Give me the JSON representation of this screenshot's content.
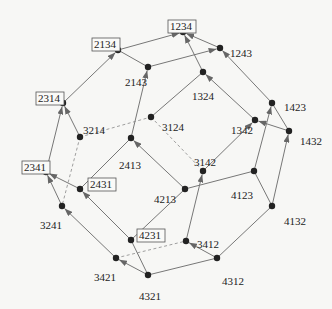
{
  "diagram": {
    "colors": {
      "edge": "#777777",
      "dashed": "#888888",
      "node": "#222222",
      "label": "#222222",
      "background": "#f7f7f5"
    },
    "nodes": [
      {
        "id": "1234",
        "x": 183,
        "y": 32,
        "boxed": true,
        "lx": 168,
        "ly": 20
      },
      {
        "id": "2134",
        "x": 118,
        "y": 50,
        "boxed": true,
        "lx": 92,
        "ly": 38
      },
      {
        "id": "1243",
        "x": 220,
        "y": 48,
        "boxed": false,
        "lx": 228,
        "ly": 47
      },
      {
        "id": "2143",
        "x": 148,
        "y": 67,
        "boxed": false,
        "lx": 123,
        "ly": 76
      },
      {
        "id": "1324",
        "x": 203,
        "y": 72,
        "boxed": false,
        "lx": 190,
        "ly": 90
      },
      {
        "id": "2314",
        "x": 63,
        "y": 103,
        "boxed": true,
        "lx": 36,
        "ly": 92
      },
      {
        "id": "3214",
        "x": 80,
        "y": 137,
        "boxed": false,
        "lx": 81,
        "ly": 124
      },
      {
        "id": "3124",
        "x": 151,
        "y": 117,
        "boxed": false,
        "lx": 160,
        "ly": 121
      },
      {
        "id": "1423",
        "x": 272,
        "y": 103,
        "boxed": false,
        "lx": 282,
        "ly": 101
      },
      {
        "id": "1342",
        "x": 255,
        "y": 120,
        "boxed": false,
        "lx": 229,
        "ly": 124
      },
      {
        "id": "1432",
        "x": 289,
        "y": 131,
        "boxed": false,
        "lx": 298,
        "ly": 135
      },
      {
        "id": "2413",
        "x": 131,
        "y": 138,
        "boxed": false,
        "lx": 117,
        "ly": 159
      },
      {
        "id": "3142",
        "x": 203,
        "y": 171,
        "boxed": false,
        "lx": 192,
        "ly": 156
      },
      {
        "id": "2341",
        "x": 46,
        "y": 172,
        "boxed": true,
        "lx": 22,
        "ly": 161
      },
      {
        "id": "4213",
        "x": 185,
        "y": 189,
        "boxed": false,
        "lx": 152,
        "ly": 193
      },
      {
        "id": "4123",
        "x": 254,
        "y": 171,
        "boxed": false,
        "lx": 229,
        "ly": 189
      },
      {
        "id": "2431",
        "x": 80,
        "y": 189,
        "boxed": true,
        "lx": 88,
        "ly": 178
      },
      {
        "id": "3241",
        "x": 62,
        "y": 206,
        "boxed": false,
        "lx": 38,
        "ly": 219
      },
      {
        "id": "4132",
        "x": 272,
        "y": 206,
        "boxed": false,
        "lx": 282,
        "ly": 215
      },
      {
        "id": "4231",
        "x": 131,
        "y": 240,
        "boxed": true,
        "lx": 137,
        "ly": 229
      },
      {
        "id": "3412",
        "x": 186,
        "y": 241,
        "boxed": false,
        "lx": 195,
        "ly": 238
      },
      {
        "id": "3421",
        "x": 116,
        "y": 258,
        "boxed": false,
        "lx": 92,
        "ly": 271
      },
      {
        "id": "4312",
        "x": 217,
        "y": 258,
        "boxed": false,
        "lx": 220,
        "ly": 275
      },
      {
        "id": "4321",
        "x": 148,
        "y": 275,
        "boxed": false,
        "lx": 137,
        "ly": 290
      }
    ],
    "edges": [
      {
        "from": "2134",
        "to": "1234",
        "style": "arrow"
      },
      {
        "from": "1243",
        "to": "1234",
        "style": "arrow"
      },
      {
        "from": "1324",
        "to": "1234",
        "style": "arrow"
      },
      {
        "from": "2134",
        "to": "2143",
        "style": "solid"
      },
      {
        "from": "2314",
        "to": "2134",
        "style": "arrow"
      },
      {
        "from": "2143",
        "to": "1243",
        "style": "arrow"
      },
      {
        "from": "2413",
        "to": "2143",
        "style": "arrow"
      },
      {
        "from": "1423",
        "to": "1243",
        "style": "arrow"
      },
      {
        "from": "3124",
        "to": "1324",
        "style": "solid"
      },
      {
        "from": "1342",
        "to": "1324",
        "style": "arrow"
      },
      {
        "from": "3214",
        "to": "2314",
        "style": "arrow"
      },
      {
        "from": "2341",
        "to": "2314",
        "style": "arrow"
      },
      {
        "from": "3214",
        "to": "3124",
        "style": "dashed"
      },
      {
        "from": "3214",
        "to": "3241",
        "style": "dashed"
      },
      {
        "from": "3124",
        "to": "3142",
        "style": "dashed"
      },
      {
        "from": "2413",
        "to": "2431",
        "style": "solid"
      },
      {
        "from": "4213",
        "to": "2413",
        "style": "arrow"
      },
      {
        "from": "2431",
        "to": "2341",
        "style": "arrow"
      },
      {
        "from": "3241",
        "to": "2341",
        "style": "arrow"
      },
      {
        "from": "4231",
        "to": "2431",
        "style": "arrow"
      },
      {
        "from": "3421",
        "to": "3241",
        "style": "arrow"
      },
      {
        "from": "3142",
        "to": "1342",
        "style": "arrow"
      },
      {
        "from": "3412",
        "to": "3142",
        "style": "arrow"
      },
      {
        "from": "4213",
        "to": "4123",
        "style": "solid"
      },
      {
        "from": "4213",
        "to": "4231",
        "style": "solid"
      },
      {
        "from": "1432",
        "to": "1342",
        "style": "arrow"
      },
      {
        "from": "1423",
        "to": "1432",
        "style": "solid"
      },
      {
        "from": "4123",
        "to": "1423",
        "style": "arrow"
      },
      {
        "from": "4132",
        "to": "1432",
        "style": "arrow"
      },
      {
        "from": "4123",
        "to": "4132",
        "style": "solid"
      },
      {
        "from": "3421",
        "to": "3412",
        "style": "dashed"
      },
      {
        "from": "4321",
        "to": "3421",
        "style": "arrow"
      },
      {
        "from": "4312",
        "to": "3412",
        "style": "arrow"
      },
      {
        "from": "4321",
        "to": "4312",
        "style": "solid"
      },
      {
        "from": "4231",
        "to": "4321",
        "style": "solid"
      },
      {
        "from": "4132",
        "to": "4312",
        "style": "solid"
      }
    ]
  }
}
